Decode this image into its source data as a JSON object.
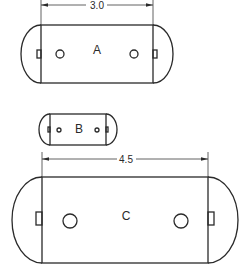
{
  "diagram": {
    "type": "technical-drawing",
    "shapes": [
      {
        "id": "A",
        "label": "A",
        "dimension": "3.0",
        "rect": {
          "x1": 41,
          "x2": 153,
          "y1": 25,
          "y2": 83
        },
        "end_arc_extent": 20,
        "holes": [
          {
            "cx": 60,
            "cy": 54,
            "r": 4
          },
          {
            "cx": 134,
            "cy": 54,
            "r": 4
          }
        ],
        "dimension_line_y": 5
      },
      {
        "id": "B",
        "label": "B",
        "dimension": null,
        "rect": {
          "x1": 50,
          "x2": 106,
          "y1": 114,
          "y2": 145
        },
        "end_arc_extent": 11,
        "holes": [
          {
            "cx": 59,
            "cy": 130,
            "r": 2
          },
          {
            "cx": 97,
            "cy": 130,
            "r": 2
          }
        ]
      },
      {
        "id": "C",
        "label": "C",
        "dimension": "4.5",
        "rect": {
          "x1": 42,
          "x2": 208,
          "y1": 177,
          "y2": 263
        },
        "end_arc_extent": 30,
        "holes": [
          {
            "cx": 70,
            "cy": 221,
            "r": 7
          },
          {
            "cx": 181,
            "cy": 221,
            "r": 7
          }
        ],
        "dimension_line_y": 159
      }
    ],
    "colors": {
      "line": "#2a2a2a",
      "background": "#ffffff"
    }
  }
}
